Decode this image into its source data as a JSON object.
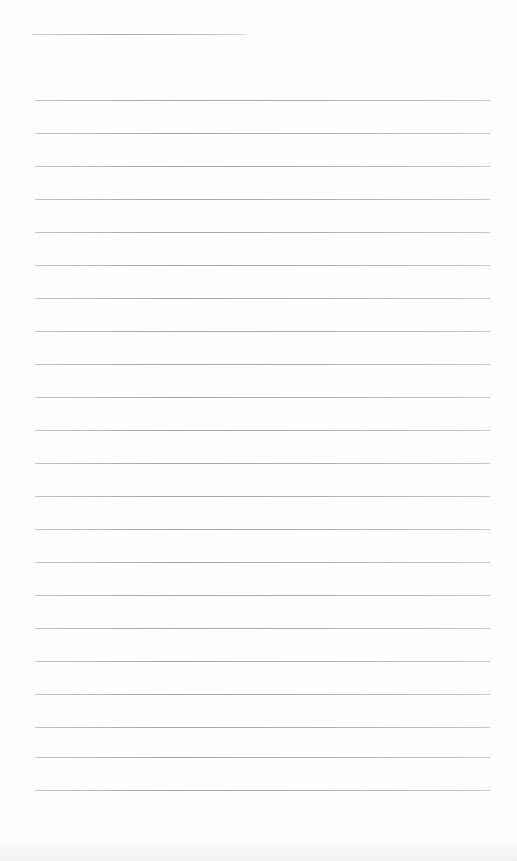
{
  "page": {
    "type": "lined-writing-sheet",
    "background_color": "#fefefe",
    "rule_color": "#acacac",
    "top_text_fragment": "",
    "title_line": {
      "x": 32,
      "y": 34,
      "width": 214
    },
    "rules": {
      "count": 22,
      "x_start": 35,
      "x_end": 490,
      "y_positions": [
        100,
        133,
        166,
        199,
        232,
        265,
        298,
        331,
        364,
        397,
        430,
        463,
        496,
        529,
        562,
        595,
        628,
        661,
        694,
        727,
        757,
        790
      ]
    }
  }
}
